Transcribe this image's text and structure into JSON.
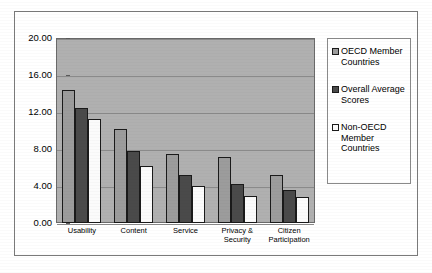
{
  "chart_data": {
    "type": "bar",
    "title": "",
    "subtitle": "",
    "xlabel": "",
    "ylabel": "",
    "categories": [
      "Usability",
      "Content",
      "Service",
      "Privacy & Security",
      "Citizen Participation"
    ],
    "series": [
      {
        "name": "OECD Member Countries",
        "color": "#9c9c9c",
        "values": [
          14.4,
          10.2,
          7.5,
          7.1,
          5.2
        ]
      },
      {
        "name": "Overall Average Scores",
        "color": "#4a4a4a",
        "values": [
          12.4,
          7.8,
          5.2,
          4.2,
          3.6
        ]
      },
      {
        "name": "Non-OECD Member Countries",
        "color": "#fbfbfb",
        "values": [
          11.2,
          6.2,
          4.0,
          2.9,
          2.8
        ]
      }
    ],
    "ylim": [
      0,
      20
    ],
    "ytick_values": [
      20,
      16,
      12,
      8,
      4,
      0
    ],
    "ytick_labels": [
      "20.00",
      "16.00",
      "12.00",
      "8.00",
      "4.00",
      "0.00"
    ],
    "grid": true,
    "legend_position": "right",
    "plot_background": "#b0b0b0"
  },
  "axis": {
    "y_labels": [
      "20.00",
      "16.00",
      "12.00",
      "8.00",
      "4.00",
      "0.00"
    ],
    "x_labels": [
      "Usability",
      "Content",
      "Service",
      "Privacy & Security",
      "Citizen Participation"
    ]
  },
  "legend": {
    "items": [
      {
        "label": "OECD Member Countries",
        "color": "#9c9c9c"
      },
      {
        "label": "Overall Average Scores",
        "color": "#4a4a4a"
      },
      {
        "label": "Non-OECD Member Countries",
        "color": "#fbfbfb"
      }
    ]
  }
}
